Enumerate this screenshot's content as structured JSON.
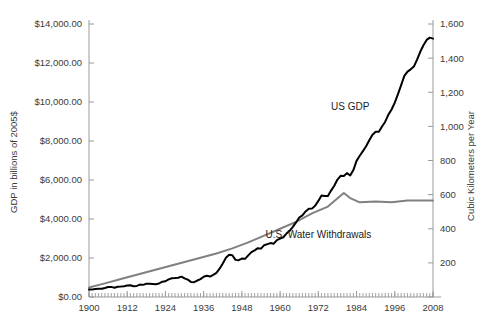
{
  "chart_data": {
    "type": "line",
    "title": "",
    "subtitle": "",
    "xlabel": "",
    "ylabel": "GDP in billions of 2005$",
    "y2label": "Cubic Kilometers per Year",
    "xlim": [
      1900,
      2008
    ],
    "ylim": [
      0,
      14000
    ],
    "y2lim": [
      0,
      1600
    ],
    "grid": false,
    "legend_position": "inline-annotation",
    "x_tick_labels": [
      "1900",
      "1912",
      "1924",
      "1936",
      "1948",
      "1960",
      "1972",
      "1984",
      "1996",
      "2008"
    ],
    "x_tick_values": [
      1900,
      1912,
      1924,
      1936,
      1948,
      1960,
      1972,
      1984,
      1996,
      2008
    ],
    "x_minor_tick_interval": 1,
    "y_tick_labels": [
      "$0.00",
      "$2,000.00",
      "$4,000.00",
      "$6,000.00",
      "$8,000.00",
      "$10,000.00",
      "$12,000.00",
      "$14,000.00"
    ],
    "y_tick_values": [
      0,
      2000,
      4000,
      6000,
      8000,
      10000,
      12000,
      14000
    ],
    "y2_tick_labels": [
      "200",
      "400",
      "600",
      "800",
      "1,000",
      "1,200",
      "1,400",
      "1,600"
    ],
    "y2_tick_values": [
      200,
      400,
      600,
      800,
      1000,
      1200,
      1400,
      1600
    ],
    "annotations": [
      {
        "text": "US GDP",
        "x": 1982,
        "y": 9600,
        "axis": "left"
      },
      {
        "text": "U.S. Water Withdrawals",
        "x": 1972,
        "y": 3050,
        "axis": "left"
      }
    ],
    "series": [
      {
        "name": "US GDP",
        "axis": "left",
        "color": "#000000",
        "width": 2.0,
        "unit": "billions of 2005$",
        "x": [
          1900,
          1901,
          1902,
          1903,
          1904,
          1905,
          1906,
          1907,
          1908,
          1909,
          1910,
          1911,
          1912,
          1913,
          1914,
          1915,
          1916,
          1917,
          1918,
          1919,
          1920,
          1921,
          1922,
          1923,
          1924,
          1925,
          1926,
          1927,
          1928,
          1929,
          1930,
          1931,
          1932,
          1933,
          1934,
          1935,
          1936,
          1937,
          1938,
          1939,
          1940,
          1941,
          1942,
          1943,
          1944,
          1945,
          1946,
          1947,
          1948,
          1949,
          1950,
          1951,
          1952,
          1953,
          1954,
          1955,
          1956,
          1957,
          1958,
          1959,
          1960,
          1961,
          1962,
          1963,
          1964,
          1965,
          1966,
          1967,
          1968,
          1969,
          1970,
          1971,
          1972,
          1973,
          1974,
          1975,
          1976,
          1977,
          1978,
          1979,
          1980,
          1981,
          1982,
          1983,
          1984,
          1985,
          1986,
          1987,
          1988,
          1989,
          1990,
          1991,
          1992,
          1993,
          1994,
          1995,
          1996,
          1997,
          1998,
          1999,
          2000,
          2001,
          2002,
          2003,
          2004,
          2005,
          2006,
          2007,
          2008
        ],
        "y": [
          460,
          470,
          500,
          520,
          515,
          560,
          620,
          630,
          575,
          640,
          650,
          675,
          715,
          730,
          670,
          690,
          775,
          755,
          820,
          825,
          815,
          795,
          840,
          950,
          980,
          1100,
          1170,
          1180,
          1195,
          1265,
          1155,
          1080,
          940,
          925,
          1025,
          1115,
          1260,
          1325,
          1275,
          1380,
          1500,
          1760,
          2090,
          2440,
          2630,
          2600,
          2310,
          2290,
          2390,
          2375,
          2590,
          2790,
          2900,
          3040,
          3010,
          3225,
          3290,
          3355,
          3320,
          3545,
          3635,
          3720,
          3945,
          4120,
          4360,
          4640,
          4945,
          5080,
          5325,
          5490,
          5500,
          5680,
          5980,
          6320,
          6290,
          6280,
          6620,
          6925,
          7310,
          7540,
          7525,
          7710,
          7560,
          7900,
          8470,
          8790,
          9080,
          9380,
          9760,
          10100,
          10285,
          10280,
          10610,
          10910,
          11350,
          11670,
          12100,
          12630,
          13180,
          13760,
          14030,
          14170,
          14340,
          14770,
          15260,
          15670,
          16000,
          16140,
          16080
        ],
        "y_plot_peak": 13300,
        "y_plot_start": 460
      },
      {
        "name": "U.S. Water Withdrawals",
        "axis": "right",
        "color": "#808080",
        "width": 2.0,
        "unit": "cubic kilometers per year",
        "x": [
          1900,
          1905,
          1910,
          1915,
          1920,
          1925,
          1930,
          1935,
          1940,
          1945,
          1950,
          1955,
          1960,
          1965,
          1970,
          1975,
          1980,
          1982,
          1985,
          1990,
          1995,
          2000,
          2005,
          2008
        ],
        "y": [
          56,
          80,
          105,
          130,
          155,
          180,
          205,
          230,
          255,
          285,
          320,
          360,
          400,
          440,
          490,
          530,
          610,
          580,
          555,
          560,
          555,
          565,
          565,
          565
        ],
        "plateau_value": 565,
        "peak_value": 610,
        "peak_year": 1980
      }
    ]
  },
  "axes": {
    "left_title": "GDP in billions of 2005$",
    "right_title": "Cubic Kilometers per Year"
  },
  "labels": {
    "gdp_series": "US GDP",
    "water_series": "U.S. Water Withdrawals"
  },
  "colors": {
    "gdp_line": "#000000",
    "water_line": "#808080",
    "axis": "#9a9a9a",
    "text": "#3a3a3a",
    "background": "#ffffff"
  }
}
